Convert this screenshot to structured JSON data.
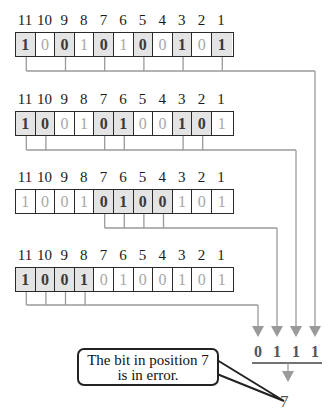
{
  "positions": [
    "11",
    "10",
    "9",
    "8",
    "7",
    "6",
    "5",
    "4",
    "3",
    "2",
    "1"
  ],
  "rows": [
    {
      "bits": [
        "1",
        "0",
        "0",
        "1",
        "0",
        "1",
        "0",
        "0",
        "1",
        "0",
        "1"
      ],
      "highlight": [
        11,
        9,
        7,
        5,
        3,
        1
      ],
      "check_bit": "1"
    },
    {
      "bits": [
        "1",
        "0",
        "0",
        "1",
        "0",
        "1",
        "0",
        "0",
        "1",
        "0",
        "1"
      ],
      "highlight": [
        11,
        10,
        7,
        6,
        3,
        2
      ],
      "check_bit": "1"
    },
    {
      "bits": [
        "1",
        "0",
        "0",
        "1",
        "0",
        "1",
        "0",
        "0",
        "1",
        "0",
        "1"
      ],
      "highlight": [
        7,
        6,
        5,
        4
      ],
      "check_bit": "1"
    },
    {
      "bits": [
        "1",
        "0",
        "0",
        "1",
        "0",
        "1",
        "0",
        "0",
        "1",
        "0",
        "1"
      ],
      "highlight": [
        11,
        10,
        9,
        8
      ],
      "check_bit": "0"
    }
  ],
  "result_bits": [
    "0",
    "1",
    "1",
    "1"
  ],
  "result_decimal": "7",
  "callout": {
    "line1": "The bit in position 7",
    "line2": "is in error."
  },
  "colors": {
    "line": "#9a9a9a",
    "highlight": "#e4e4e4",
    "border": "#2a2a2a"
  }
}
